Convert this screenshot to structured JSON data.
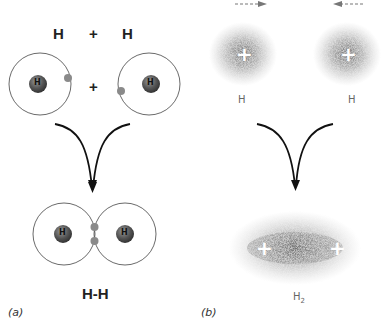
{
  "panel_a": {
    "label": "(a)",
    "title_left": "H",
    "title_plus": "+",
    "title_right": "H",
    "atoms_plus": "+",
    "nucleus_label": "H",
    "product_label": "H-H"
  },
  "panel_b": {
    "label": "(b)",
    "atom_left_label": "H",
    "atom_right_label": "H",
    "nucleus_charge": "+",
    "product_label": "H",
    "product_subscript": "2"
  },
  "colors": {
    "nucleus": "#555555",
    "electron": "#8a8a8a",
    "orbit": "#444444",
    "cloud": "#777777",
    "arrow": "#111111"
  }
}
